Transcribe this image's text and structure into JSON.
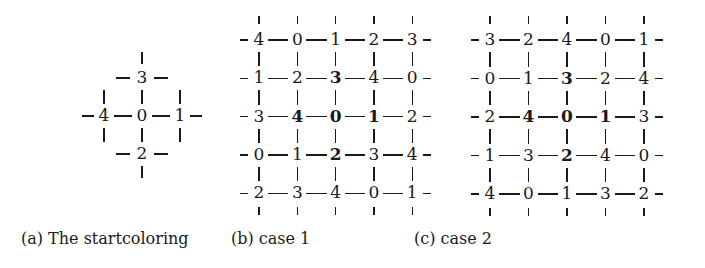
{
  "figure": {
    "panels": [
      {
        "id": "a",
        "caption": "(a) The startcoloring",
        "type": "cross",
        "center": "0",
        "top": "3",
        "left": "4",
        "right": "1",
        "bottom": "2"
      },
      {
        "id": "b",
        "caption": "(b) case 1",
        "type": "grid",
        "rows": [
          [
            "4",
            "0",
            "1",
            "2",
            "3"
          ],
          [
            "1",
            "2",
            "3",
            "4",
            "0"
          ],
          [
            "3",
            "4",
            "0",
            "1",
            "2"
          ],
          [
            "0",
            "1",
            "2",
            "3",
            "4"
          ],
          [
            "2",
            "3",
            "4",
            "0",
            "1"
          ]
        ],
        "bold_cells": [
          [
            1,
            2
          ],
          [
            2,
            1
          ],
          [
            2,
            2
          ],
          [
            2,
            3
          ],
          [
            3,
            2
          ]
        ]
      },
      {
        "id": "c",
        "caption": "(c) case 2",
        "type": "grid",
        "rows": [
          [
            "3",
            "2",
            "4",
            "0",
            "1"
          ],
          [
            "0",
            "1",
            "3",
            "2",
            "4"
          ],
          [
            "2",
            "4",
            "0",
            "1",
            "3"
          ],
          [
            "1",
            "3",
            "2",
            "4",
            "0"
          ],
          [
            "4",
            "0",
            "1",
            "3",
            "2"
          ]
        ],
        "bold_cells": [
          [
            1,
            2
          ],
          [
            2,
            1
          ],
          [
            2,
            2
          ],
          [
            2,
            3
          ],
          [
            3,
            2
          ]
        ]
      }
    ]
  }
}
